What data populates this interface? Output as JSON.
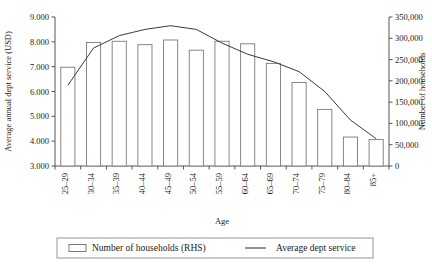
{
  "chart_data": {
    "type": "bar",
    "title": "",
    "subtitle": "",
    "xlabel": "Age",
    "categories": [
      "25–29",
      "30–34",
      "35–39",
      "40–44",
      "45–49",
      "50–54",
      "55–59",
      "60–64",
      "65–69",
      "70–74",
      "75–79",
      "80–84",
      "85+"
    ],
    "grid": false,
    "legend_position": "bottom",
    "axes": {
      "left": {
        "label": "Average annual dept service (USD)",
        "ticks": [
          "3.000",
          "4.000",
          "5.000",
          "6.000",
          "7.000",
          "8.000",
          "9.000"
        ],
        "tick_values": [
          3000,
          4000,
          5000,
          6000,
          7000,
          8000,
          9000
        ],
        "min": 3000,
        "max": 9000
      },
      "right": {
        "label": "Number of households",
        "ticks": [
          "0",
          "50,000",
          "100,000",
          "150,000",
          "200,000",
          "250,000",
          "300,000",
          "350,000"
        ],
        "tick_values": [
          0,
          50000,
          100000,
          150000,
          200000,
          250000,
          300000,
          350000
        ],
        "min": 0,
        "max": 350000
      }
    },
    "series": [
      {
        "name": "Number of households (RHS)",
        "type": "bar",
        "axis": "right",
        "values": [
          232000,
          290000,
          293000,
          285000,
          296000,
          272000,
          293000,
          287000,
          241000,
          196000,
          133000,
          68000,
          62000
        ]
      },
      {
        "name": "Average dept service",
        "type": "line",
        "axis": "left",
        "values": [
          6250,
          7750,
          8250,
          8500,
          8650,
          8500,
          7950,
          7500,
          7200,
          6800,
          6000,
          4850,
          4100
        ]
      }
    ]
  },
  "legend": {
    "items": [
      {
        "label": "Number of households (RHS)",
        "marker": "bar-swatch"
      },
      {
        "label": "Average dept service",
        "marker": "line-swatch"
      }
    ]
  }
}
